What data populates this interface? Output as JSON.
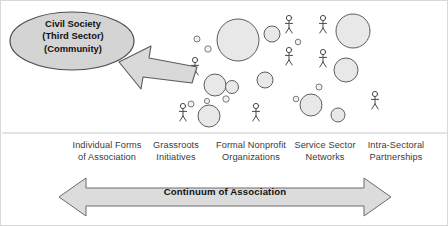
{
  "diagram": {
    "title_node": {
      "name": "civil-society-ellipse",
      "lines": [
        "Civil Society",
        "(Third Sector)",
        "(Community)"
      ],
      "fill": "#d4d4d4",
      "stroke": "#4d4d4d"
    },
    "pointer_arrow": {
      "name": "left-pointing-arrow",
      "direction": "left",
      "fill": "#d9d9d9",
      "stroke": "#5a5a5a"
    },
    "cluster": {
      "name": "association-cluster",
      "description": "Scatter of circles and stick figures representing associations",
      "circle_fill": "#e8e8e8",
      "circle_stroke": "#5e5e5e",
      "figure_stroke": "#4a4a4a",
      "circles": [
        {
          "cx": 237,
          "cy": 39,
          "r": 21
        },
        {
          "cx": 352,
          "cy": 30,
          "r": 17
        },
        {
          "cx": 271,
          "cy": 33,
          "r": 8
        },
        {
          "cx": 196,
          "cy": 38,
          "r": 3
        },
        {
          "cx": 207,
          "cy": 48,
          "r": 3.2
        },
        {
          "cx": 297,
          "cy": 41,
          "r": 2.8
        },
        {
          "cx": 214,
          "cy": 84,
          "r": 11
        },
        {
          "cx": 264,
          "cy": 79,
          "r": 8
        },
        {
          "cx": 231,
          "cy": 86,
          "r": 6.5
        },
        {
          "cx": 345,
          "cy": 69,
          "r": 12
        },
        {
          "cx": 295,
          "cy": 98,
          "r": 2.8
        },
        {
          "cx": 225,
          "cy": 98,
          "r": 3.2
        },
        {
          "cx": 206,
          "cy": 100,
          "r": 2.6
        },
        {
          "cx": 318,
          "cy": 86,
          "r": 3
        },
        {
          "cx": 190,
          "cy": 103,
          "r": 3
        },
        {
          "cx": 310,
          "cy": 104,
          "r": 11
        },
        {
          "cx": 337,
          "cy": 114,
          "r": 7
        },
        {
          "cx": 208,
          "cy": 115,
          "r": 11
        }
      ],
      "stick_figures": [
        {
          "x": 194,
          "y": 66
        },
        {
          "x": 288,
          "y": 24
        },
        {
          "x": 288,
          "y": 56
        },
        {
          "x": 322,
          "y": 24
        },
        {
          "x": 322,
          "y": 58
        },
        {
          "x": 182,
          "y": 112
        },
        {
          "x": 255,
          "y": 112
        },
        {
          "x": 374,
          "y": 100
        }
      ]
    },
    "axis_labels": [
      {
        "name": "label-individual-forms",
        "cx": 106,
        "lines": [
          "Individual Forms",
          "of Association"
        ]
      },
      {
        "name": "label-grassroots",
        "cx": 175,
        "lines": [
          "Grassroots",
          "Initiatives"
        ]
      },
      {
        "name": "label-formal-nonprofit",
        "cx": 250,
        "lines": [
          "Formal Nonprofit",
          "Organizations"
        ]
      },
      {
        "name": "label-service-sector",
        "cx": 324,
        "lines": [
          "Service Sector",
          "Networks"
        ]
      },
      {
        "name": "label-intra-sectoral",
        "cx": 396,
        "lines": [
          "Intra-Sectoral",
          "Partnerships"
        ]
      }
    ],
    "continuum_arrow": {
      "name": "continuum-double-arrow",
      "label": "Continuum of Association",
      "fill": "#dcdcdc",
      "stroke": "#6b6b6b"
    },
    "divider": {
      "name": "horizontal-divider",
      "stroke": "#c9c9c9"
    }
  }
}
